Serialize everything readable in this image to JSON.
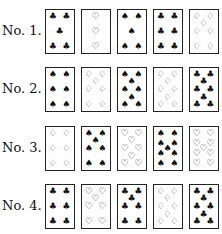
{
  "rows": [
    {
      "label": "No. 1.",
      "cards": [
        {
          "rank": 5,
          "suit": "clubs",
          "pip": "♣"
        },
        {
          "rank": 3,
          "suit": "hearts",
          "pip": "♡"
        },
        {
          "rank": 5,
          "suit": "spades",
          "pip": "♠"
        },
        {
          "rank": 6,
          "suit": "clubs",
          "pip": "♣"
        },
        {
          "rank": 7,
          "suit": "diamonds",
          "pip": "♢"
        }
      ]
    },
    {
      "label": "No. 2.",
      "cards": [
        {
          "rank": 6,
          "suit": "spades",
          "pip": "♠"
        },
        {
          "rank": 7,
          "suit": "diamonds",
          "pip": "♢"
        },
        {
          "rank": 8,
          "suit": "spades",
          "pip": "♠"
        },
        {
          "rank": 8,
          "suit": "diamonds",
          "pip": "♢"
        },
        {
          "rank": 8,
          "suit": "clubs",
          "pip": "♣"
        }
      ]
    },
    {
      "label": "No. 3.",
      "cards": [
        {
          "rank": 6,
          "suit": "diamonds",
          "pip": "♢"
        },
        {
          "rank": 7,
          "suit": "spades",
          "pip": "♠"
        },
        {
          "rank": 8,
          "suit": "hearts",
          "pip": "♡"
        },
        {
          "rank": 9,
          "suit": "spades",
          "pip": "♠"
        },
        {
          "rank": 9,
          "suit": "hearts",
          "pip": "♡"
        }
      ]
    },
    {
      "label": "No. 4.",
      "cards": [
        {
          "rank": 6,
          "suit": "clubs",
          "pip": "♣"
        },
        {
          "rank": 7,
          "suit": "hearts",
          "pip": "♡"
        },
        {
          "rank": 7,
          "suit": "clubs",
          "pip": "♣"
        },
        {
          "rank": 8,
          "suit": "diamonds",
          "pip": "♢"
        },
        {
          "rank": 8,
          "suit": "clubs",
          "pip": "♣"
        }
      ]
    }
  ]
}
